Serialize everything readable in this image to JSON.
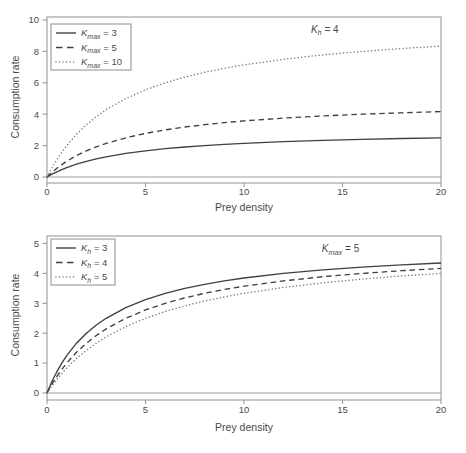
{
  "figure": {
    "background": "#ffffff",
    "text_color": "#4a4a4a",
    "frame_color": "#9b9b9b",
    "solid_color": "#3f3f3f",
    "dashed_color": "#3f3f3f",
    "dotted_color": "#757575"
  },
  "chart_data": [
    {
      "id": "top-chart",
      "type": "line",
      "title": "",
      "xlabel": "Prey density",
      "ylabel": "Consumption rate",
      "xlim": [
        0,
        20
      ],
      "ylim": [
        0,
        10
      ],
      "xticks": [
        0,
        5,
        10,
        15,
        20
      ],
      "yticks": [
        0,
        2,
        4,
        6,
        8,
        10
      ],
      "grid": false,
      "legend_position": "top-left",
      "annotation": {
        "base": "K",
        "sub": "h",
        "rest": "= 4",
        "x": 14.1,
        "y": 9.2
      },
      "x": [
        0,
        0.25,
        0.5,
        0.75,
        1,
        1.5,
        2,
        2.5,
        3,
        4,
        5,
        6,
        7,
        8,
        9,
        10,
        12,
        14,
        16,
        18,
        20
      ],
      "series": [
        {
          "label": {
            "base": "K",
            "sub": "max",
            "rest": "= 3"
          },
          "style": "solid",
          "values": [
            0,
            0.176,
            0.333,
            0.474,
            0.6,
            0.818,
            1,
            1.154,
            1.286,
            1.5,
            1.667,
            1.8,
            1.909,
            2,
            2.077,
            2.143,
            2.25,
            2.333,
            2.4,
            2.455,
            2.5
          ]
        },
        {
          "label": {
            "base": "K",
            "sub": "max",
            "rest": "= 5"
          },
          "style": "dashed",
          "values": [
            0,
            0.294,
            0.556,
            0.789,
            1,
            1.364,
            1.667,
            1.923,
            2.143,
            2.5,
            2.778,
            3,
            3.182,
            3.333,
            3.462,
            3.571,
            3.75,
            3.889,
            4,
            4.091,
            4.167
          ]
        },
        {
          "label": {
            "base": "K",
            "sub": "max",
            "rest": "= 10"
          },
          "style": "dotted",
          "values": [
            0,
            0.588,
            1.111,
            1.579,
            2,
            2.727,
            3.333,
            3.846,
            4.286,
            5,
            5.556,
            6,
            6.364,
            6.667,
            6.923,
            7.143,
            7.5,
            7.778,
            8,
            8.182,
            8.333
          ]
        }
      ]
    },
    {
      "id": "bottom-chart",
      "type": "line",
      "title": "",
      "xlabel": "Prey density",
      "ylabel": "Consumption rate",
      "xlim": [
        0,
        20
      ],
      "ylim": [
        0,
        5
      ],
      "xticks": [
        0,
        5,
        10,
        15,
        20
      ],
      "yticks": [
        0,
        1,
        2,
        3,
        4,
        5
      ],
      "grid": false,
      "legend_position": "top-left",
      "annotation": {
        "base": "K",
        "sub": "max",
        "rest": "= 5",
        "x": 14.9,
        "y": 4.7
      },
      "x": [
        0,
        0.25,
        0.5,
        0.75,
        1,
        1.5,
        2,
        2.5,
        3,
        4,
        5,
        6,
        7,
        8,
        9,
        10,
        12,
        14,
        16,
        18,
        20
      ],
      "series": [
        {
          "label": {
            "base": "K",
            "sub": "h",
            "rest": "= 3"
          },
          "style": "solid",
          "values": [
            0,
            0.385,
            0.714,
            1,
            1.25,
            1.667,
            2,
            2.273,
            2.5,
            2.857,
            3.125,
            3.333,
            3.5,
            3.636,
            3.75,
            3.846,
            4,
            4.118,
            4.211,
            4.286,
            4.348
          ]
        },
        {
          "label": {
            "base": "K",
            "sub": "h",
            "rest": "= 4"
          },
          "style": "dashed",
          "values": [
            0,
            0.294,
            0.556,
            0.789,
            1,
            1.364,
            1.667,
            1.923,
            2.143,
            2.5,
            2.778,
            3,
            3.182,
            3.333,
            3.462,
            3.571,
            3.75,
            3.889,
            4,
            4.091,
            4.167
          ]
        },
        {
          "label": {
            "base": "K",
            "sub": "h",
            "rest": "= 5"
          },
          "style": "dotted",
          "values": [
            0,
            0.238,
            0.455,
            0.652,
            0.833,
            1.154,
            1.429,
            1.667,
            1.875,
            2.222,
            2.5,
            2.727,
            2.917,
            3.077,
            3.214,
            3.333,
            3.529,
            3.684,
            3.81,
            3.913,
            4
          ]
        }
      ]
    }
  ]
}
